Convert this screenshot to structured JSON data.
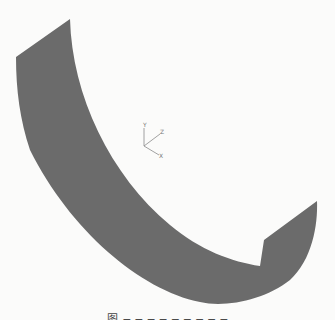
{
  "figure": {
    "surface_color": "#6b6b6b",
    "background_color": "#fbfbfa",
    "axis_triad": {
      "labels": {
        "x": "X",
        "y": "Y",
        "z": "Z"
      },
      "color": "#8a8a8a"
    },
    "caption": "图 ─ ─ ─ ─ ─ ─ ─ ─ ─"
  }
}
